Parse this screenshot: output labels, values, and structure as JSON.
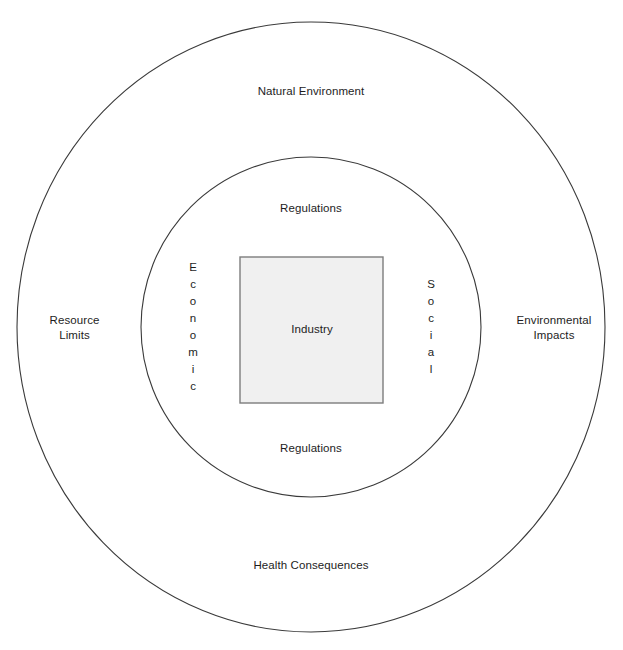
{
  "diagram": {
    "canvas": {
      "width": 623,
      "height": 650,
      "background": "#ffffff"
    },
    "stroke_color": "#3a3a3a",
    "text_color": "#1d1d1d",
    "rings": [
      {
        "name": "outer-ring",
        "shape": "ellipse",
        "center": [
          311,
          327
        ],
        "rx": 294,
        "ry": 305,
        "fill": "#ffffff",
        "stroke": "#3a3a3a",
        "stroke_width": 1.1,
        "labels": [
          "Natural Environment",
          "Resource Limits",
          "Environmental Impacts",
          "Health Consequences"
        ]
      },
      {
        "name": "inner-ring",
        "shape": "circle",
        "center": [
          311,
          327
        ],
        "r": 170,
        "fill": "#ffffff",
        "stroke": "#3a3a3a",
        "stroke_width": 1.1,
        "labels": [
          "Regulations",
          "Economic",
          "Social",
          "Regulations"
        ]
      }
    ],
    "core": {
      "name": "core-square",
      "shape": "rect",
      "x": 240,
      "y": 257,
      "width": 143,
      "height": 146,
      "fill": "#f0f0f0",
      "stroke": "#7d7d7d",
      "stroke_width": 1.4,
      "label": "Industry"
    }
  },
  "labels": {
    "natural_environment": "Natural Environment",
    "resource_limits": "Resource\nLimits",
    "environmental_impacts": "Environmental\nImpacts",
    "health_consequences": "Health Consequences",
    "regulations_top": "Regulations",
    "regulations_bottom": "Regulations",
    "industry": "Industry",
    "economic": "Economic",
    "social": "Social"
  }
}
